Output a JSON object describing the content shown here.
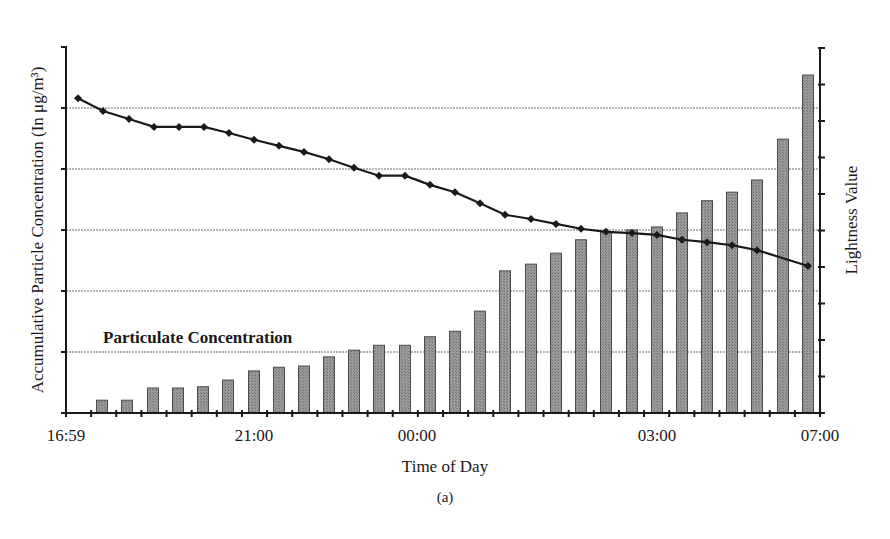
{
  "figure": {
    "caption": "(a)"
  },
  "chart_data": {
    "type": "bar+line",
    "title": "",
    "xlabel": "Time of Day",
    "ylabel_left": "Accumulative Particle Concentration (In μg/m³)",
    "ylabel_right": "Lightness Value",
    "x_tick_labels": [
      "16:59",
      "21:00",
      "00:00",
      "03:00",
      "07:00"
    ],
    "grid": true,
    "grid_lines": "horizontal",
    "left_axis_divisions": 6,
    "left_axis_tick_labels": [],
    "right_axis_tick_labels": [],
    "annotations": [
      "Particulate Concentration"
    ],
    "legend": null,
    "series": [
      {
        "name": "Particulate Concentration",
        "type": "bar",
        "axis": "left",
        "units": "gridline divisions (unlabeled)",
        "values": [
          0.21,
          0.21,
          0.41,
          0.41,
          0.43,
          0.54,
          0.69,
          0.75,
          0.77,
          0.92,
          1.03,
          1.11,
          1.11,
          1.25,
          1.34,
          1.67,
          2.33,
          2.44,
          2.62,
          2.84,
          2.97,
          3.0,
          3.05,
          3.28,
          3.48,
          3.62,
          3.82,
          4.49,
          5.54
        ]
      },
      {
        "name": "Lightness Value",
        "type": "line",
        "axis": "right",
        "units": "left-axis gridline divisions (unlabeled)",
        "values": [
          5.16,
          4.95,
          4.82,
          4.69,
          4.69,
          4.69,
          4.59,
          4.48,
          4.38,
          4.28,
          4.16,
          4.02,
          3.89,
          3.89,
          3.74,
          3.62,
          3.44,
          3.25,
          3.18,
          3.1,
          3.02,
          2.97,
          2.95,
          2.92,
          2.84,
          2.8,
          2.75,
          2.67,
          2.41
        ]
      }
    ],
    "ylim_left": [
      0,
      6
    ],
    "layout": {
      "plot_left": 66,
      "plot_right": 820,
      "plot_top": 48,
      "baseline": 413,
      "div_px": 61,
      "bar_x": [
        102,
        127,
        153,
        178,
        203,
        228,
        254,
        279,
        304,
        329,
        354,
        379,
        405,
        430,
        455,
        480,
        505,
        531,
        556,
        581,
        606,
        632,
        657,
        682,
        707,
        732,
        757,
        783,
        808
      ],
      "line_x": [
        78,
        103,
        129,
        154,
        179,
        204,
        229,
        254,
        279,
        304,
        329,
        354,
        379,
        405,
        430,
        455,
        480,
        505,
        531,
        556,
        581,
        606,
        632,
        657,
        682,
        707,
        732,
        757,
        808
      ],
      "x_tick_label_x": [
        66,
        254,
        417,
        657,
        820
      ]
    }
  },
  "colors": {
    "bar_fill": "#8c8c8c",
    "bar_edge": "#4a4a4a",
    "line": "#1a1a1a",
    "grid": "#b5b5b5",
    "axis": "#1a1a1a"
  }
}
